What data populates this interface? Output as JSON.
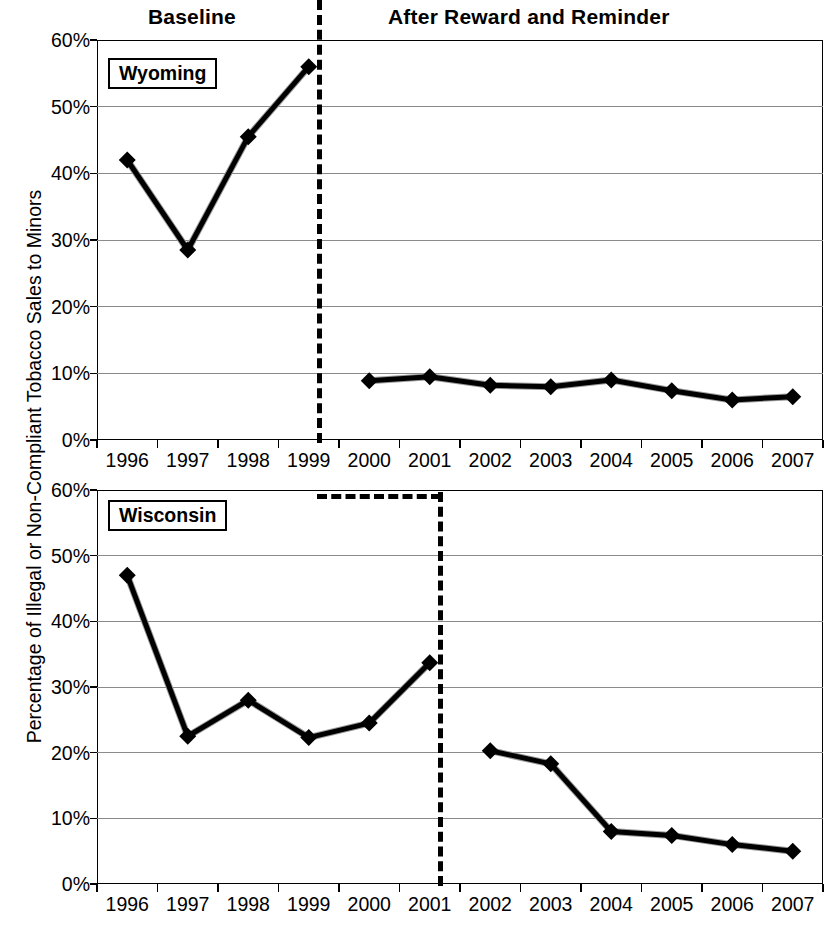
{
  "headers": {
    "baseline": "Baseline",
    "after": "After Reward and Reminder"
  },
  "axis": {
    "ylabel": "Percentage of Illegal or Non-Compliant Tobacco Sales to Minors",
    "yticks": [
      "0%",
      "10%",
      "20%",
      "30%",
      "40%",
      "50%",
      "60%"
    ],
    "xticks": [
      "1996",
      "1997",
      "1998",
      "1999",
      "2000",
      "2001",
      "2002",
      "2003",
      "2004",
      "2005",
      "2006",
      "2007"
    ]
  },
  "panels": {
    "wyoming": {
      "label": "Wyoming",
      "divider_after_year": "1999"
    },
    "wisconsin": {
      "label": "Wisconsin",
      "divider_after_year": "2001"
    }
  },
  "chart_data": [
    {
      "type": "line",
      "title": "Wyoming",
      "xlabel": "",
      "ylabel": "Percentage of Illegal or Non-Compliant Tobacco Sales to Minors",
      "ylim": [
        0,
        60
      ],
      "ytick_interval": 10,
      "grid": true,
      "legend": "none",
      "marker": "diamond",
      "categories": [
        "1996",
        "1997",
        "1998",
        "1999",
        "2000",
        "2001",
        "2002",
        "2003",
        "2004",
        "2005",
        "2006",
        "2007"
      ],
      "series": [
        {
          "name": "Baseline",
          "annotation": "Baseline",
          "x": [
            "1996",
            "1997",
            "1998",
            "1999"
          ],
          "values": [
            42.0,
            28.5,
            45.5,
            56.0
          ]
        },
        {
          "name": "After Reward and Reminder",
          "annotation": "After Reward and Reminder",
          "x": [
            "2000",
            "2001",
            "2002",
            "2003",
            "2004",
            "2005",
            "2006",
            "2007"
          ],
          "values": [
            8.9,
            9.5,
            8.2,
            8.0,
            9.0,
            7.4,
            6.0,
            6.5
          ]
        }
      ],
      "divider": {
        "label": "intervention-start",
        "between": [
          "1999",
          "2000"
        ],
        "style": "dashed"
      }
    },
    {
      "type": "line",
      "title": "Wisconsin",
      "xlabel": "",
      "ylabel": "Percentage of Illegal or Non-Compliant Tobacco Sales to Minors",
      "ylim": [
        0,
        60
      ],
      "ytick_interval": 10,
      "grid": true,
      "legend": "none",
      "marker": "diamond",
      "categories": [
        "1996",
        "1997",
        "1998",
        "1999",
        "2000",
        "2001",
        "2002",
        "2003",
        "2004",
        "2005",
        "2006",
        "2007"
      ],
      "series": [
        {
          "name": "Baseline",
          "annotation": "Baseline",
          "x": [
            "1996",
            "1997",
            "1998",
            "1999",
            "2000",
            "2001"
          ],
          "values": [
            47.0,
            22.5,
            28.0,
            22.3,
            24.5,
            33.7
          ]
        },
        {
          "name": "After Reward and Reminder",
          "annotation": "After Reward and Reminder",
          "x": [
            "2002",
            "2003",
            "2004",
            "2005",
            "2006",
            "2007"
          ],
          "values": [
            20.3,
            18.3,
            8.0,
            7.4,
            6.0,
            5.0
          ]
        }
      ],
      "divider": {
        "label": "intervention-start",
        "between": [
          "2001",
          "2002"
        ],
        "style": "dashed"
      }
    }
  ]
}
